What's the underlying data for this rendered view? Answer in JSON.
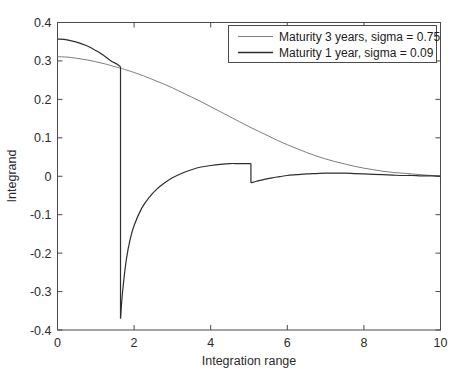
{
  "chart_data": {
    "type": "line",
    "title": "",
    "subtitle": "",
    "xlabel": "Integration range",
    "ylabel": "Integrand",
    "xlim": [
      0,
      10
    ],
    "ylim": [
      -0.4,
      0.4
    ],
    "xticks": [
      0,
      2,
      4,
      6,
      8,
      10
    ],
    "xticklabels": [
      "0",
      "2",
      "4",
      "6",
      "8",
      "10"
    ],
    "yticks": [
      0.4,
      0.3,
      0.2,
      0.1,
      0,
      -0.1,
      -0.2,
      -0.3,
      -0.4
    ],
    "yticklabels": [
      "0.4",
      "0.3",
      "0.2",
      "0.1",
      "0",
      "-0.1",
      "-0.2",
      "-0.3",
      "-0.4"
    ],
    "grid": false,
    "legend_position": "upper right",
    "series": [
      {
        "name": "Maturity 3 years, sigma = 0.75",
        "color": "#7d7d7d",
        "linewidth": 1.0,
        "x": [
          0,
          0.25,
          0.5,
          0.75,
          1.0,
          1.25,
          1.5,
          1.65,
          1.75,
          2.0,
          2.25,
          2.5,
          2.75,
          3.0,
          3.25,
          3.5,
          3.75,
          4.0,
          4.25,
          4.5,
          4.75,
          5.0,
          5.25,
          5.5,
          5.75,
          6.0,
          6.25,
          6.5,
          6.75,
          7.0,
          7.25,
          7.5,
          7.75,
          8.0,
          8.25,
          8.5,
          8.75,
          9.0,
          9.25,
          9.5,
          9.75,
          10.0
        ],
        "y": [
          0.311,
          0.31,
          0.307,
          0.303,
          0.298,
          0.292,
          0.285,
          0.281,
          0.278,
          0.27,
          0.261,
          0.251,
          0.241,
          0.23,
          0.218,
          0.206,
          0.194,
          0.181,
          0.168,
          0.155,
          0.142,
          0.129,
          0.117,
          0.105,
          0.093,
          0.082,
          0.072,
          0.062,
          0.053,
          0.045,
          0.038,
          0.032,
          0.026,
          0.021,
          0.017,
          0.013,
          0.01,
          0.008,
          0.006,
          0.004,
          0.002,
          0.001
        ]
      },
      {
        "name": "Maturity 1 year, sigma = 0.09",
        "color": "#2e2e2e",
        "linewidth": 1.2,
        "discontinuities": [
          {
            "x": 1.645,
            "y_before": 0.285,
            "y_after": -0.37
          },
          {
            "x": 5.05,
            "y_before": 0.033,
            "y_after": -0.017
          }
        ],
        "segments": [
          {
            "x": [
              0,
              0.25,
              0.5,
              0.75,
              1.0,
              1.2,
              1.4,
              1.55,
              1.645
            ],
            "y": [
              0.357,
              0.355,
              0.349,
              0.34,
              0.327,
              0.315,
              0.3,
              0.292,
              0.285
            ]
          },
          {
            "x": [
              1.645,
              1.7,
              1.8,
              1.9,
              2.0,
              2.2,
              2.4,
              2.6,
              2.8,
              3.0,
              3.25,
              3.5,
              3.75,
              4.0,
              4.25,
              4.5,
              4.7,
              4.85,
              5.05
            ],
            "y": [
              -0.37,
              -0.3,
              -0.215,
              -0.163,
              -0.128,
              -0.083,
              -0.054,
              -0.033,
              -0.017,
              -0.004,
              0.008,
              0.017,
              0.024,
              0.028,
              0.031,
              0.033,
              0.033,
              0.033,
              0.033
            ]
          },
          {
            "x": [
              5.05,
              5.2,
              5.4,
              5.6,
              5.8,
              6.0,
              6.25,
              6.5,
              6.75,
              7.0,
              7.25,
              7.5,
              7.75,
              8.0,
              8.25,
              8.5,
              8.75,
              9.0,
              9.25,
              9.5,
              9.75,
              10.0
            ],
            "y": [
              -0.017,
              -0.013,
              -0.008,
              -0.004,
              -0.001,
              0.002,
              0.004,
              0.006,
              0.007,
              0.008,
              0.008,
              0.008,
              0.007,
              0.006,
              0.005,
              0.004,
              0.003,
              0.002,
              0.002,
              0.001,
              0.001,
              0.0
            ]
          }
        ]
      }
    ]
  },
  "legend": {
    "entries": [
      {
        "label": "Maturity 3 years, sigma = 0.75"
      },
      {
        "label": "Maturity 1 year, sigma = 0.09"
      }
    ]
  },
  "axes": {
    "x_label": "Integration range",
    "y_label": "Integrand"
  }
}
